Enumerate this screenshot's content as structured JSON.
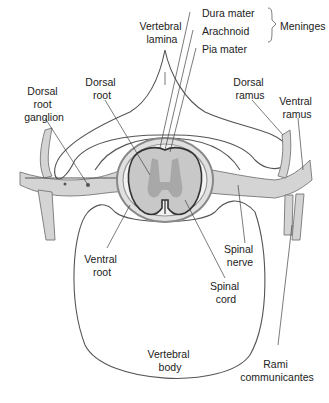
{
  "diagram": {
    "labels": {
      "vertebral_lamina": [
        "Vertebral",
        "lamina"
      ],
      "dura_mater": "Dura mater",
      "arachnoid": "Arachnoid",
      "pia_mater": "Pia mater",
      "meninges": "Meninges",
      "dorsal_root": [
        "Dorsal",
        "root"
      ],
      "dorsal_root_ganglion": [
        "Dorsal",
        "root",
        "ganglion"
      ],
      "dorsal_ramus": [
        "Dorsal",
        "ramus"
      ],
      "ventral_ramus": [
        "Ventral",
        "ramus"
      ],
      "ventral_root": [
        "Ventral",
        "root"
      ],
      "spinal_nerve": [
        "Spinal",
        "nerve"
      ],
      "spinal_cord": [
        "Spinal",
        "cord"
      ],
      "vertebral_body": [
        "Vertebral",
        "body"
      ],
      "rami_communicantes": [
        "Rami",
        "communicantes"
      ]
    },
    "colors": {
      "outline": "#555555",
      "nerve_fill": "#d4d4d4",
      "gray_matter": "#a8a8a8",
      "cord_fill": "#c8c8c8",
      "text": "#222222"
    }
  }
}
